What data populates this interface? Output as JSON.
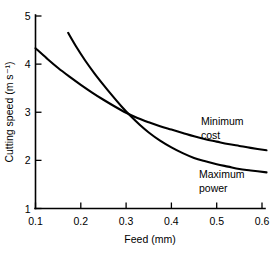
{
  "chart_data": {
    "type": "line",
    "title": "",
    "xlabel": "Feed (mm)",
    "ylabel": "Cutting speed (m s⁻¹)",
    "xlim": [
      0.1,
      0.61
    ],
    "ylim": [
      1,
      5
    ],
    "xticks": [
      "0.1",
      "0.2",
      "0.3",
      "0.4",
      "0.5",
      "0.6"
    ],
    "xtick_values": [
      0.1,
      0.2,
      0.3,
      0.4,
      0.5,
      0.6
    ],
    "yticks": [
      "1",
      "2",
      "3",
      "4",
      "5"
    ],
    "ytick_values": [
      1,
      2,
      3,
      4,
      5
    ],
    "grid": false,
    "legend": "inline-annotations",
    "series": [
      {
        "name": "Minimum cost",
        "label_line1": "Minimum",
        "label_line2": "cost",
        "color": "#000000",
        "x": [
          0.1,
          0.125,
          0.15,
          0.175,
          0.2,
          0.225,
          0.25,
          0.275,
          0.3,
          0.325,
          0.35,
          0.375,
          0.4,
          0.425,
          0.45,
          0.475,
          0.5,
          0.525,
          0.55,
          0.575,
          0.61
        ],
        "y": [
          4.33,
          4.12,
          3.92,
          3.74,
          3.57,
          3.41,
          3.26,
          3.12,
          2.99,
          2.88,
          2.79,
          2.71,
          2.64,
          2.57,
          2.5,
          2.44,
          2.39,
          2.34,
          2.3,
          2.26,
          2.21
        ]
      },
      {
        "name": "Maximum power",
        "label_line1": "Maximum",
        "label_line2": "power",
        "color": "#000000",
        "x": [
          0.172,
          0.19,
          0.21,
          0.23,
          0.25,
          0.27,
          0.29,
          0.31,
          0.33,
          0.35,
          0.375,
          0.4,
          0.425,
          0.45,
          0.475,
          0.5,
          0.525,
          0.55,
          0.575,
          0.61
        ],
        "y": [
          4.65,
          4.36,
          4.07,
          3.81,
          3.57,
          3.34,
          3.12,
          2.92,
          2.74,
          2.58,
          2.41,
          2.27,
          2.15,
          2.05,
          1.98,
          1.92,
          1.87,
          1.82,
          1.79,
          1.75
        ]
      }
    ],
    "annotations": [
      {
        "text": "Minimum cost",
        "at_x": 0.475,
        "at_y": 2.9
      },
      {
        "text": "Maximum power",
        "at_x": 0.475,
        "at_y": 1.98
      }
    ],
    "intersection": {
      "x": 0.305,
      "y": 2.8
    }
  }
}
